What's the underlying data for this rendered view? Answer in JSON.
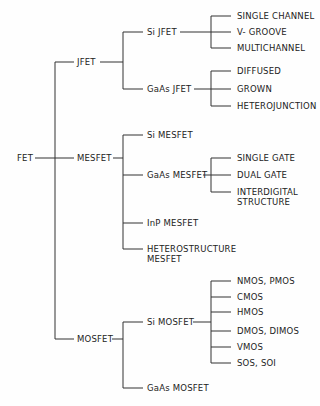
{
  "root": {
    "id": "fet",
    "label": "FET",
    "x": 17,
    "y": 158
  },
  "nodes": [
    {
      "id": "jfet",
      "label": "JFET",
      "x": 77,
      "y": 62
    },
    {
      "id": "mesfet",
      "label": "MESFET",
      "x": 77,
      "y": 158
    },
    {
      "id": "mosfet",
      "label": "MOSFET",
      "x": 77,
      "y": 339
    },
    {
      "id": "si-jfet",
      "label": "Si JFET",
      "x": 147,
      "y": 32
    },
    {
      "id": "gaas-jfet",
      "label": "GaAs JFET",
      "x": 147,
      "y": 89
    },
    {
      "id": "si-mesfet",
      "label": "Si MESFET",
      "x": 147,
      "y": 135
    },
    {
      "id": "gaas-mesfet",
      "label": "GaAs MESFET",
      "x": 147,
      "y": 175
    },
    {
      "id": "inp-mesfet",
      "label": "InP MESFET",
      "x": 147,
      "y": 223
    },
    {
      "id": "hetero-mesfet-1",
      "label": "HETEROSTRUCTURE",
      "x": 147,
      "y": 249
    },
    {
      "id": "hetero-mesfet-2",
      "label": "MESFET",
      "x": 147,
      "y": 259
    },
    {
      "id": "si-mosfet",
      "label": "Si MOSFET",
      "x": 147,
      "y": 322
    },
    {
      "id": "gaas-mosfet",
      "label": "GaAs MOSFET",
      "x": 147,
      "y": 388
    },
    {
      "id": "single-channel",
      "label": "SINGLE CHANNEL",
      "x": 237,
      "y": 16
    },
    {
      "id": "v-groove",
      "label": "V- GROOVE",
      "x": 237,
      "y": 32
    },
    {
      "id": "multichannel",
      "label": "MULTICHANNEL",
      "x": 237,
      "y": 48
    },
    {
      "id": "diffused",
      "label": "DIFFUSED",
      "x": 237,
      "y": 71
    },
    {
      "id": "grown",
      "label": "GROWN",
      "x": 237,
      "y": 89
    },
    {
      "id": "heterojunction",
      "label": "HETEROJUNCTION",
      "x": 237,
      "y": 106
    },
    {
      "id": "single-gate",
      "label": "SINGLE GATE",
      "x": 237,
      "y": 158
    },
    {
      "id": "dual-gate",
      "label": "DUAL GATE",
      "x": 237,
      "y": 175
    },
    {
      "id": "interdigital-1",
      "label": "INTERDIGITAL",
      "x": 237,
      "y": 192
    },
    {
      "id": "interdigital-2",
      "label": "STRUCTURE",
      "x": 237,
      "y": 202
    },
    {
      "id": "nmos-pmos",
      "label": "NMOS, PMOS",
      "x": 237,
      "y": 281
    },
    {
      "id": "cmos",
      "label": "CMOS",
      "x": 237,
      "y": 297
    },
    {
      "id": "hmos",
      "label": "HMOS",
      "x": 237,
      "y": 312
    },
    {
      "id": "dmos-dimos",
      "label": "DMOS, DIMOS",
      "x": 237,
      "y": 331
    },
    {
      "id": "vmos",
      "label": "VMOS",
      "x": 237,
      "y": 347
    },
    {
      "id": "sos-soi",
      "label": "SOS, SOI",
      "x": 237,
      "y": 363
    }
  ],
  "lines": [
    [
      35,
      158,
      74,
      158
    ],
    [
      55,
      62,
      55,
      339
    ],
    [
      55,
      62,
      74,
      62
    ],
    [
      55,
      339,
      74,
      339
    ],
    [
      100,
      62,
      123,
      62
    ],
    [
      123,
      32,
      123,
      89
    ],
    [
      123,
      32,
      143,
      32
    ],
    [
      123,
      89,
      143,
      89
    ],
    [
      180,
      32,
      211,
      32
    ],
    [
      211,
      16,
      211,
      48
    ],
    [
      211,
      16,
      231,
      16
    ],
    [
      211,
      32,
      231,
      32
    ],
    [
      211,
      48,
      231,
      48
    ],
    [
      194,
      89,
      211,
      89
    ],
    [
      211,
      71,
      211,
      106
    ],
    [
      211,
      71,
      231,
      71
    ],
    [
      211,
      89,
      231,
      89
    ],
    [
      211,
      106,
      231,
      106
    ],
    [
      113,
      158,
      123,
      158
    ],
    [
      123,
      135,
      123,
      249
    ],
    [
      123,
      135,
      143,
      135
    ],
    [
      123,
      175,
      143,
      175
    ],
    [
      123,
      223,
      143,
      223
    ],
    [
      123,
      249,
      143,
      249
    ],
    [
      203,
      175,
      211,
      175
    ],
    [
      211,
      158,
      211,
      192
    ],
    [
      211,
      158,
      231,
      158
    ],
    [
      211,
      175,
      231,
      175
    ],
    [
      211,
      192,
      231,
      192
    ],
    [
      112,
      339,
      123,
      339
    ],
    [
      123,
      322,
      123,
      388
    ],
    [
      123,
      322,
      143,
      322
    ],
    [
      123,
      388,
      143,
      388
    ],
    [
      193,
      322,
      211,
      322
    ],
    [
      211,
      281,
      211,
      363
    ],
    [
      211,
      281,
      231,
      281
    ],
    [
      211,
      297,
      231,
      297
    ],
    [
      211,
      312,
      231,
      312
    ],
    [
      211,
      331,
      231,
      331
    ],
    [
      211,
      347,
      231,
      347
    ],
    [
      211,
      363,
      231,
      363
    ]
  ]
}
